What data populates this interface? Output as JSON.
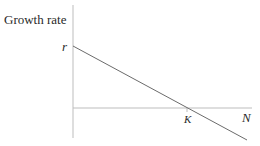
{
  "diagram": {
    "y_axis_label": "Growth rate",
    "y_intercept_label": "r",
    "x_intercept_label": "K",
    "x_axis_label": "N",
    "line_color": "#6b6b6b",
    "axis_color": "#b8b8b8"
  }
}
